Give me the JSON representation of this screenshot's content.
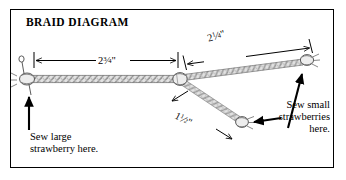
{
  "document": {
    "title": "BRAID DIAGRAM",
    "border_color": "#000000",
    "background_color": "#ffffff",
    "ink_color": "#000000",
    "cord_color": "#c9c9c9"
  },
  "dimensions": {
    "main_braid": {
      "label": "2¾\"",
      "whole": "2",
      "numerator": "3",
      "denominator": "4",
      "unit": "\"",
      "value_inches": 2.75,
      "orientation": "horizontal"
    },
    "upper_branch": {
      "label": "2¼\"",
      "whole": "2",
      "numerator": "1",
      "denominator": "4",
      "unit": "\"",
      "value_inches": 2.25,
      "orientation": "diagonal-up-right"
    },
    "lower_branch": {
      "label": "1½\"",
      "whole": "1",
      "numerator": "1",
      "denominator": "2",
      "unit": "\"",
      "value_inches": 1.5,
      "orientation": "diagonal-down-right"
    }
  },
  "captions": {
    "left": {
      "line1": "Sew large",
      "line2": "strawberry here.",
      "points_to": "left-end-knot"
    },
    "right": {
      "line1": "Sew small",
      "line2": "strawberries",
      "line3": "here.",
      "points_to": "branch-end-knots"
    }
  },
  "parts": {
    "left_end_knot": "left-end-knot",
    "center_junction_knot": "center-junction-knot",
    "upper_branch_knot": "upper-branch-end-knot",
    "lower_branch_knot": "lower-branch-end-knot",
    "main_cord": "main-braided-cord",
    "upper_cord": "upper-branch-cord",
    "lower_cord": "lower-branch-cord"
  }
}
